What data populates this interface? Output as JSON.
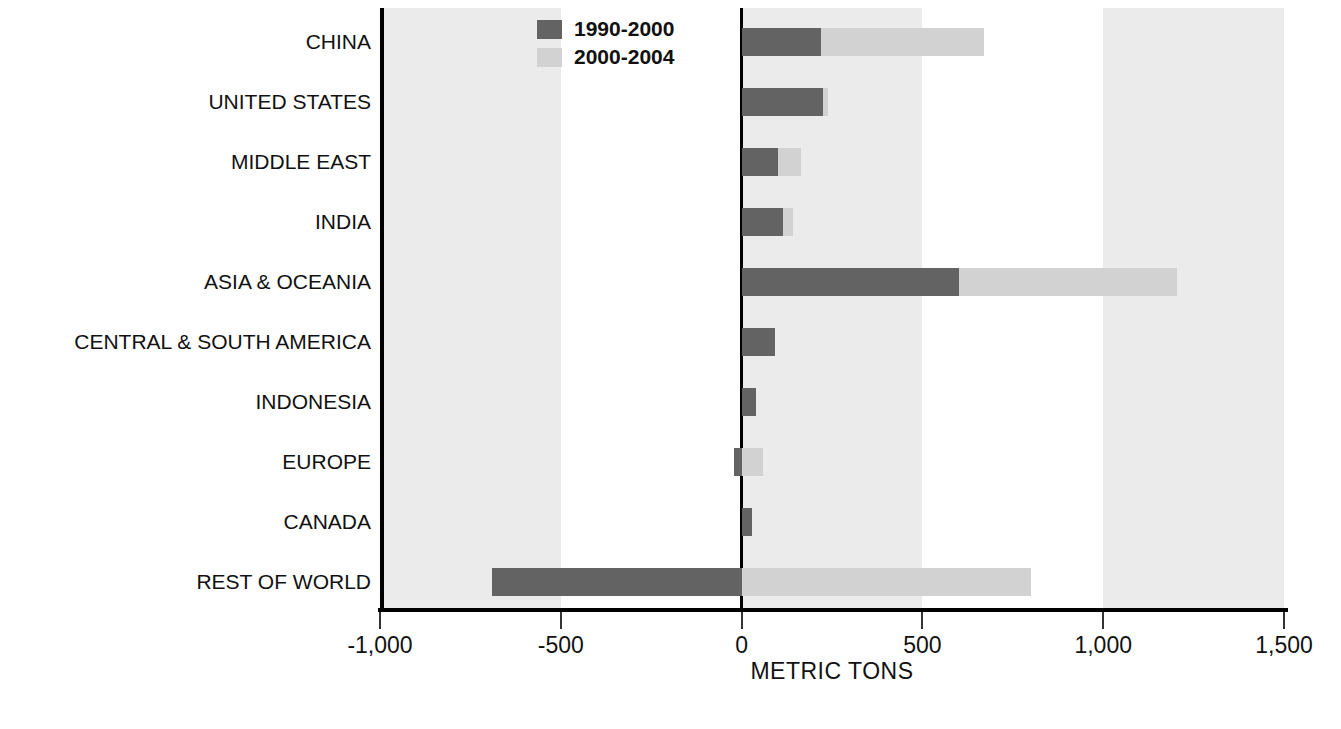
{
  "chart_data": {
    "type": "bar",
    "orientation": "horizontal",
    "stacked": true,
    "title": "",
    "xlabel": "METRIC TONS",
    "ylabel": "",
    "xlim": [
      -1000,
      1500
    ],
    "xticks": [
      -1000,
      -500,
      0,
      500,
      1000,
      1500
    ],
    "xtick_labels": [
      "-1,000",
      "-500",
      "0",
      "500",
      "1,000",
      "1,500"
    ],
    "grid": false,
    "banded_background": true,
    "legend_position": "top-left-inside",
    "categories": [
      "CHINA",
      "UNITED STATES",
      "MIDDLE EAST",
      "INDIA",
      "ASIA & OCEANIA",
      "CENTRAL & SOUTH AMERICA",
      "INDONESIA",
      "EUROPE",
      "CANADA",
      "REST OF WORLD"
    ],
    "series": [
      {
        "name": "1990-2000",
        "color": "#636363",
        "values": [
          220,
          225,
          100,
          115,
          600,
          93,
          40,
          -20,
          30,
          -690
        ]
      },
      {
        "name": "2000-2004",
        "color": "#d2d2d2",
        "values": [
          450,
          15,
          63,
          28,
          605,
          0,
          0,
          60,
          0,
          800
        ]
      }
    ],
    "totals": [
      670,
      240,
      163,
      143,
      1205,
      93,
      40,
      40,
      30,
      110
    ]
  },
  "axis": {
    "x_title": "METRIC TONS"
  },
  "legend": {
    "items": [
      {
        "label": "1990-2000",
        "color": "#636363",
        "swatch": "legend-swatch-dark"
      },
      {
        "label": "2000-2004",
        "color": "#d2d2d2",
        "swatch": "legend-swatch-light"
      }
    ]
  },
  "colors": {
    "series_1990_2000": "#636363",
    "series_2000_2004": "#d2d2d2",
    "background_band": "#ebebeb",
    "axis": "#000000",
    "text": "#111111",
    "page_background": "#ffffff"
  }
}
